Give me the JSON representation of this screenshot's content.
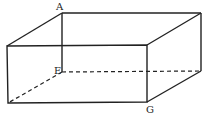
{
  "diagram": {
    "labels": {
      "A": "A",
      "E": "E",
      "G": "G"
    },
    "stroke_color": "#222222",
    "background": "#ffffff"
  }
}
